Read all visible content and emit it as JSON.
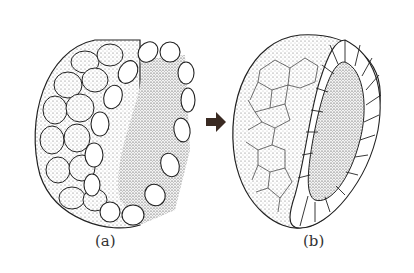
{
  "figure": {
    "panels": [
      {
        "id": "a",
        "label": "(a)",
        "description": "spherical cluster of cells, partially cut away showing outer layer of rounded cells"
      },
      {
        "id": "b",
        "label": "(b)",
        "description": "hemispherical section showing polygonal outer surface and single layer of cells surrounding inner cavity"
      }
    ],
    "arrow": {
      "direction": "right",
      "color": "#3a2a22"
    }
  }
}
